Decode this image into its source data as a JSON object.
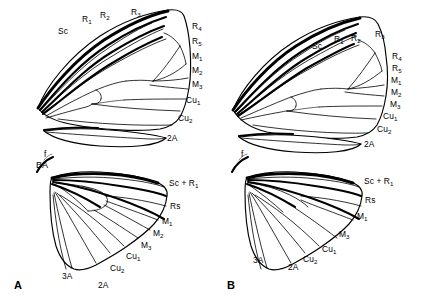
{
  "figure": {
    "background_color": "#ffffff",
    "line_color": "#000000",
    "panels": [
      {
        "id": "A",
        "letter": "A",
        "wings": [
          {
            "name": "forewing",
            "vein_labels": [
              "Sc",
              "R1",
              "R2",
              "R3",
              "R4",
              "R5",
              "M1",
              "M2",
              "M3",
              "Cu1",
              "Cu2",
              "2A"
            ]
          },
          {
            "name": "hindwing",
            "vein_labels": [
              "f",
              "BA",
              "Sc + R1",
              "Rs",
              "M1",
              "M2",
              "M3",
              "Cu1",
              "Cu2",
              "2A",
              "3A"
            ]
          }
        ]
      },
      {
        "id": "B",
        "letter": "B",
        "wings": [
          {
            "name": "forewing",
            "vein_labels": [
              "Sc",
              "R1",
              "R2",
              "R3",
              "R4",
              "R5",
              "M1",
              "M2",
              "M3",
              "Cu1",
              "Cu2",
              "2A"
            ]
          },
          {
            "name": "hindwing",
            "vein_labels": [
              "f",
              "Sc + R1",
              "Rs",
              "M1",
              "M3",
              "Cu1",
              "Cu2",
              "2A",
              "3A"
            ]
          }
        ]
      }
    ]
  },
  "labels": {
    "a_fore": {
      "sc": "Sc",
      "r1": "R",
      "r1s": "1",
      "r2": "R",
      "r2s": "2",
      "r3": "R",
      "r3s": "3",
      "r4": "R",
      "r4s": "4",
      "r5": "R",
      "r5s": "5",
      "m1": "M",
      "m1s": "1",
      "m2": "M",
      "m2s": "2",
      "m3": "M",
      "m3s": "3",
      "cu1": "Cu",
      "cu1s": "1",
      "cu2": "Cu",
      "cu2s": "2",
      "a2": "2A"
    },
    "a_hind": {
      "f": "f",
      "ba": "BA",
      "scr1": "Sc + R",
      "scr1s": "1",
      "rs": "Rs",
      "m1": "M",
      "m1s": "1",
      "m2": "M",
      "m2s": "2",
      "m3": "M",
      "m3s": "3",
      "cu1": "Cu",
      "cu1s": "1",
      "cu2": "Cu",
      "cu2s": "2",
      "a2": "2A",
      "a3": "3A"
    },
    "b_fore": {
      "sc": "Sc",
      "r1": "R",
      "r1s": "1",
      "r2": "R",
      "r2s": "2",
      "r3": "R",
      "r3s": "3",
      "r4": "R",
      "r4s": "4",
      "r5": "R",
      "r5s": "5",
      "m1": "M",
      "m1s": "1",
      "m2": "M",
      "m2s": "2",
      "m3": "M",
      "m3s": "3",
      "cu1": "Cu",
      "cu1s": "1",
      "cu2": "Cu",
      "cu2s": "2",
      "a2": "2A"
    },
    "b_hind": {
      "f": "f",
      "scr1": "Sc + R",
      "scr1s": "1",
      "rs": "Rs",
      "m1": "M",
      "m1s": "1",
      "m3": "M",
      "m3s": "3",
      "cu1": "Cu",
      "cu1s": "1",
      "cu2": "Cu",
      "cu2s": "2",
      "a2": "2A",
      "a3": "3A"
    },
    "panel_a": "A",
    "panel_b": "B"
  }
}
